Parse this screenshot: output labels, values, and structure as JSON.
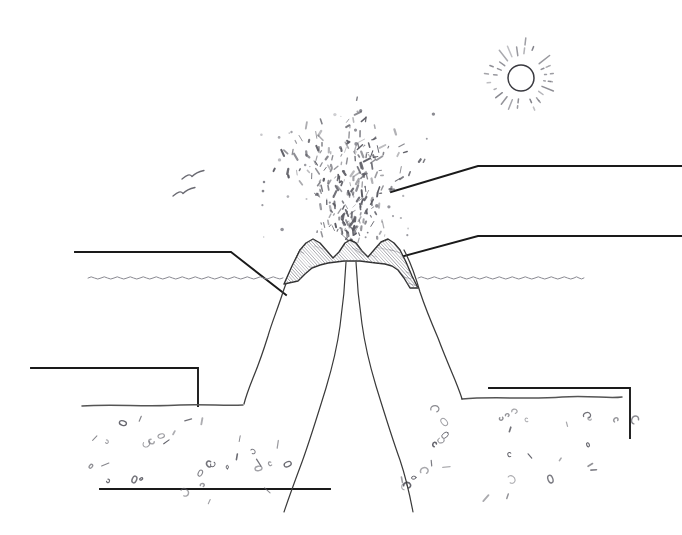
{
  "scene": {
    "title": "Erupting submarine volcano cross-section (unlabeled worksheet diagram)",
    "medium": "pencil line drawing",
    "background_color": "#ffffff",
    "width": 682,
    "height": 535
  },
  "palette": {
    "ink": "#1a1a1a",
    "line": "#3b3b3b",
    "light_pencil": "#8a8a92",
    "hatch": "#777780",
    "paper": "#ffffff"
  },
  "elements": {
    "sun": {
      "name": "sun",
      "center_x": 521,
      "center_y": 78,
      "radius": 13,
      "ray_count": 24,
      "ray_inner": 20,
      "ray_outer": 45,
      "style": "broken dashed rays"
    },
    "birds": {
      "name": "seagulls",
      "count": 2,
      "positions": [
        [
          193,
          176
        ],
        [
          184,
          193
        ]
      ]
    },
    "water": {
      "name": "sea-surface",
      "y": 278,
      "left_span": [
        88,
        283
      ],
      "right_span": [
        418,
        584
      ],
      "wave_amplitude": 2.4,
      "wave_period": 13
    },
    "volcano": {
      "name": "volcano-cone",
      "crater_center_x": 350,
      "rim_top_y": 238,
      "base_y": 405,
      "left_base_x": 243,
      "right_base_x": 462,
      "rim_shading": "diagonal hatching"
    },
    "conduit": {
      "name": "magma-conduit",
      "top_x": 350,
      "top_y": 262,
      "bottom_left_x": 283,
      "bottom_right_x": 412,
      "bottom_y": 512
    },
    "eruption": {
      "name": "eruption-plume",
      "origin": [
        350,
        240
      ],
      "top_y": 104,
      "spread_left_x": 283,
      "spread_right_x": 432,
      "fleck_count": 190,
      "description": "scattered ash and lava flecks in arcing jets"
    },
    "seafloor": {
      "name": "seafloor",
      "left_y": 405,
      "right_y": 398,
      "left_span": [
        82,
        243
      ],
      "right_span": [
        462,
        622
      ],
      "sediment_marks": 58
    }
  },
  "callouts": [
    {
      "id": "callout-left",
      "name": "callout-left",
      "label": "",
      "path": "M75,252 L231,252 L286,295",
      "anchor": "volcano flank below sea level",
      "text_side": "left"
    },
    {
      "id": "callout-upper-right",
      "name": "callout-upper-right",
      "label": "",
      "path": "M391,192 L478,166 L682,166",
      "anchor": "eruption plume",
      "text_side": "right"
    },
    {
      "id": "callout-lower-right",
      "name": "callout-lower-right",
      "label": "",
      "path": "M393,259 L478,236 L682,236",
      "anchor": "crater rim",
      "text_side": "right"
    },
    {
      "id": "callout-bottom-left",
      "name": "callout-bottom-left",
      "label": "",
      "path": "M31,368 L198,368 L198,406",
      "anchor": "seafloor left",
      "text_side": "left"
    },
    {
      "id": "callout-bottom-center",
      "name": "callout-bottom-center",
      "label": "",
      "path": "M100,489 L330,489",
      "anchor": "magma conduit",
      "text_side": "left"
    },
    {
      "id": "callout-bottom-right",
      "name": "callout-bottom-right",
      "label": "",
      "path": "M489,388 L630,388 L630,438",
      "anchor": "seafloor right",
      "text_side": "right"
    }
  ]
}
